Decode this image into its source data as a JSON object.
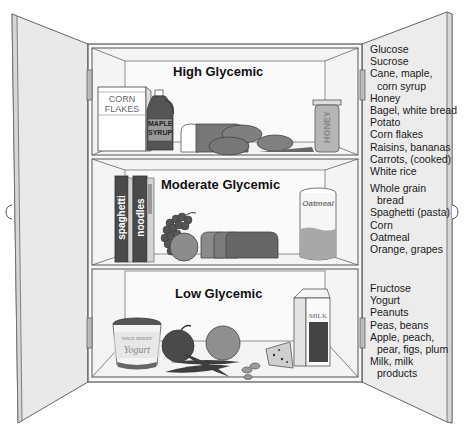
{
  "shelves": [
    {
      "title": "High Glycemic",
      "items": [
        {
          "text": "Glucose"
        },
        {
          "text": "Sucrose"
        },
        {
          "text": "Cane, maple,",
          "cont": "corn syrup"
        },
        {
          "text": "Honey"
        },
        {
          "text": "Bagel, white bread"
        },
        {
          "text": "Potato"
        },
        {
          "text": "Corn flakes"
        },
        {
          "text": "Raisins, bananas"
        },
        {
          "text": "Carrots, (cooked)"
        },
        {
          "text": "White rice"
        }
      ],
      "illustration_labels": {
        "cereal_box_line1": "CORN",
        "cereal_box_line2": "FLAKES",
        "syrup_line1": "MAPLE",
        "syrup_line2": "SYRUP",
        "honey_jar": "HONEY"
      }
    },
    {
      "title": "Moderate Glycemic",
      "items": [
        {
          "text": "Whole grain",
          "cont": "bread"
        },
        {
          "text": "Spaghetti (pasta)"
        },
        {
          "text": "Corn"
        },
        {
          "text": "Oatmeal"
        },
        {
          "text": "Orange, grapes"
        }
      ],
      "illustration_labels": {
        "box1": "spaghetti",
        "box2": "noodles",
        "oatmeal_jar": "Oatmeal"
      }
    },
    {
      "title": "Low Glycemic",
      "items": [
        {
          "text": "Fructose"
        },
        {
          "text": "Yogurt"
        },
        {
          "text": "Peanuts"
        },
        {
          "text": "Peas, beans"
        },
        {
          "text": "Apple, peach,",
          "cont": "pear, figs, plum"
        },
        {
          "text": "Milk, milk",
          "cont": "products"
        }
      ],
      "illustration_labels": {
        "yogurt_top": "WILD BERRY",
        "yogurt_script": "Yogurt",
        "milk_carton": "MILK"
      }
    }
  ],
  "colors": {
    "cabinet_fill": "#f4f4f4",
    "door_fill": "#e9e9e9",
    "outline": "#555555",
    "dark_item": "#4a4a4a",
    "mid_item": "#8a8a8a"
  }
}
